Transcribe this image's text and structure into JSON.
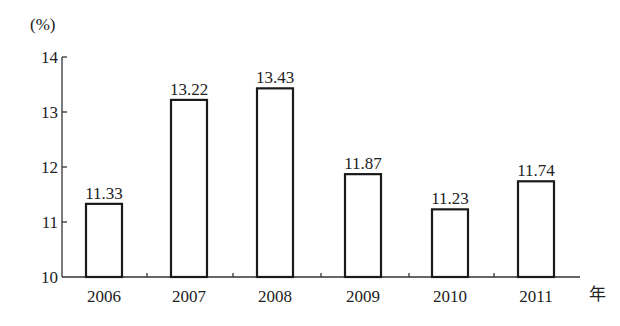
{
  "chart_data": {
    "type": "bar",
    "title": "",
    "xlabel": "年",
    "ylabel": "(%)",
    "categories": [
      "2006",
      "2007",
      "2008",
      "2009",
      "2010",
      "2011"
    ],
    "values": [
      11.33,
      13.22,
      13.43,
      11.87,
      11.23,
      11.74
    ],
    "data_labels": [
      "11.33",
      "13.22",
      "13.43",
      "11.87",
      "11.23",
      "11.74"
    ],
    "ylim": [
      10,
      14
    ],
    "yticks": [
      10,
      11,
      12,
      13,
      14
    ],
    "ytick_labels": [
      "10",
      "11",
      "12",
      "13",
      "14"
    ],
    "grid": false,
    "legend": null,
    "bar_style": "hollow outlined"
  }
}
